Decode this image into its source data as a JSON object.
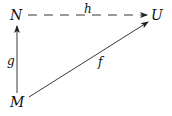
{
  "diagram": {
    "type": "commutative-triangle",
    "nodes": {
      "N": {
        "label": "N"
      },
      "U": {
        "label": "U"
      },
      "M": {
        "label": "M"
      }
    },
    "edges": [
      {
        "id": "h",
        "label": "h",
        "from": "N",
        "to": "U",
        "style": "dashed"
      },
      {
        "id": "g",
        "label": "g",
        "from": "M",
        "to": "N",
        "style": "solid"
      },
      {
        "id": "f",
        "label": "f",
        "from": "M",
        "to": "U",
        "style": "solid"
      }
    ],
    "colors": {
      "stroke": "#222222",
      "text": "#111111",
      "background": "#ffffff"
    }
  }
}
